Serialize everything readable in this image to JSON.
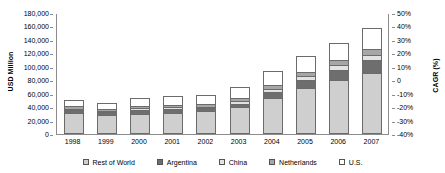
{
  "chart_data": {
    "type": "bar",
    "subtype": "stacked-column",
    "title": "",
    "xlabel": "",
    "ylabel": "USD Million",
    "y2label": "CAGR (%)",
    "categories": [
      "1998",
      "1999",
      "2000",
      "2001",
      "2002",
      "2003",
      "2004",
      "2005",
      "2006",
      "2007"
    ],
    "series": [
      {
        "name": "Rest of World",
        "color": "#cfcfcf",
        "values": [
          31000,
          28000,
          30500,
          32000,
          34500,
          39500,
          54000,
          69000,
          80000,
          91000
        ]
      },
      {
        "name": "Argentina",
        "color": "#6e6e6e",
        "values": [
          5000,
          4500,
          5500,
          5500,
          4000,
          5500,
          8000,
          12000,
          15500,
          18500
        ]
      },
      {
        "name": "China",
        "color": "#e2e2e2",
        "values": [
          1500,
          1500,
          2000,
          2000,
          2000,
          3500,
          4500,
          5500,
          7000,
          8500
        ]
      },
      {
        "name": "Netherlands",
        "color": "#a6a6a6",
        "values": [
          3500,
          3000,
          3500,
          4000,
          4000,
          4500,
          6500,
          6500,
          7500,
          8000
        ]
      },
      {
        "name": "U.S.",
        "color": "#ffffff",
        "values": [
          9000,
          9000,
          11500,
          12500,
          13500,
          17000,
          21000,
          23000,
          25000,
          32000
        ]
      }
    ],
    "totals": [
      50000,
      46000,
      53000,
      56000,
      58000,
      70000,
      94000,
      116000,
      135000,
      158000
    ],
    "ylim": [
      0,
      180000
    ],
    "yticks": [
      "0",
      "20,000",
      "40,000",
      "60,000",
      "80,000",
      "100,000",
      "120,000",
      "140,000",
      "160,000",
      "180,000"
    ],
    "y2lim": [
      -40,
      50
    ],
    "y2ticks": [
      "-40%",
      "-30%",
      "-20%",
      "-10%",
      "0",
      "10%",
      "20%",
      "30%",
      "40%",
      "50%"
    ],
    "grid": false,
    "legend_position": "bottom"
  },
  "axes": {
    "left_title": "USD Million",
    "right_title": "CAGR (%)"
  },
  "legend": {
    "items": [
      {
        "label": "Rest of World",
        "color": "#cfcfcf"
      },
      {
        "label": "Argentina",
        "color": "#6e6e6e"
      },
      {
        "label": "China",
        "color": "#e2e2e2"
      },
      {
        "label": "Netherlands",
        "color": "#a6a6a6"
      },
      {
        "label": "U.S.",
        "color": "#ffffff"
      }
    ]
  }
}
